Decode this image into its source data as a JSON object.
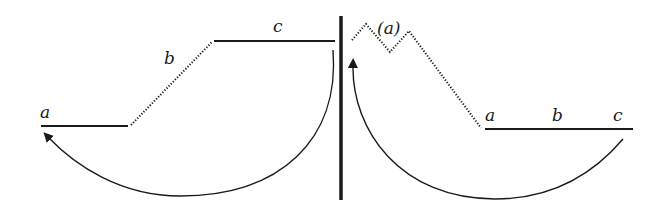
{
  "diagram": {
    "colors": {
      "stroke": "#1a1a1a",
      "background": "#ffffff"
    },
    "left_panel": {
      "labels": {
        "a": "a",
        "b": "b",
        "c": "c"
      },
      "segments": [
        {
          "id": "a",
          "style": "solid",
          "from": [
            41,
            126
          ],
          "to": [
            128,
            126
          ]
        },
        {
          "id": "b",
          "style": "dotted",
          "from": [
            130,
            126
          ],
          "to": [
            212,
            41
          ]
        },
        {
          "id": "c",
          "style": "solid",
          "from": [
            214,
            41
          ],
          "to": [
            335,
            41
          ]
        }
      ],
      "arrow": {
        "from": "c",
        "to": "a",
        "direction": "counter-clockwise"
      }
    },
    "divider": {
      "x": 341,
      "y_top": 16,
      "y_bottom": 200
    },
    "right_panel": {
      "labels": {
        "zigzag": "(a)",
        "a": "a",
        "b": "b",
        "c": "c"
      },
      "segments": [
        {
          "id": "zigzag",
          "style": "dotted",
          "points": [
            [
              352,
              40
            ],
            [
              366,
              24
            ],
            [
              390,
              52
            ],
            [
              409,
              31
            ],
            [
              481,
              128
            ]
          ]
        },
        {
          "id": "abc",
          "style": "solid",
          "from": [
            485,
            129
          ],
          "to": [
            633,
            129
          ]
        }
      ],
      "arrow": {
        "from": "c",
        "to": "(a)",
        "direction": "clockwise"
      }
    }
  }
}
